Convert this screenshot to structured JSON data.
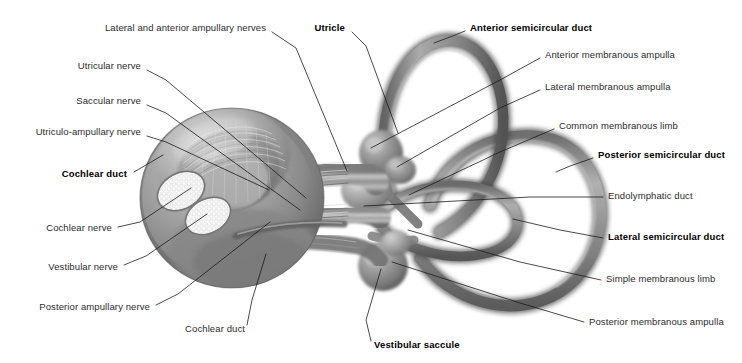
{
  "figure": {
    "style": "grayscale anatomical illustration",
    "width": 742,
    "height": 363,
    "background_color": "#ffffff",
    "text_color": "#2b2b2b",
    "bold_text_color": "#000000",
    "leader_line_color": "#1a1a1a"
  },
  "labels": [
    {
      "id": "lateral-and-anterior-ampullary-nerves",
      "text": "Lateral and anterior ampullary nerves",
      "bold": false,
      "side": "right-aligned",
      "x": 266,
      "y": 30,
      "leader": [
        [
          272,
          32
        ],
        [
          296,
          48
        ],
        [
          347,
          171
        ]
      ]
    },
    {
      "id": "utricle",
      "text": "Utricle",
      "bold": true,
      "side": "right-aligned",
      "x": 345,
      "y": 30,
      "leader": [
        [
          352,
          32
        ],
        [
          366,
          46
        ],
        [
          398,
          133
        ]
      ]
    },
    {
      "id": "utricular-nerve",
      "text": "Utricular nerve",
      "bold": false,
      "side": "right-aligned",
      "x": 141,
      "y": 68,
      "leader": [
        [
          147,
          70
        ],
        [
          166,
          80
        ],
        [
          306,
          198
        ]
      ]
    },
    {
      "id": "saccular-nerve",
      "text": "Saccular nerve",
      "bold": false,
      "side": "right-aligned",
      "x": 141,
      "y": 103,
      "leader": [
        [
          147,
          105
        ],
        [
          166,
          113
        ],
        [
          300,
          210
        ]
      ]
    },
    {
      "id": "utriculo-ampullary-nerve",
      "text": "Utriculo-ampullary nerve",
      "bold": false,
      "side": "right-aligned",
      "x": 141,
      "y": 134,
      "leader": [
        [
          147,
          136
        ],
        [
          166,
          142
        ],
        [
          269,
          190
        ]
      ]
    },
    {
      "id": "cochlear-duct-bold",
      "text": "Cochlear duct",
      "bold": true,
      "side": "right-aligned",
      "x": 127,
      "y": 176,
      "leader": [
        [
          134,
          172
        ],
        [
          163,
          155
        ]
      ]
    },
    {
      "id": "cochlear-nerve",
      "text": "Cochlear nerve",
      "bold": false,
      "side": "right-aligned",
      "x": 112,
      "y": 230,
      "leader": [
        [
          118,
          227
        ],
        [
          140,
          222
        ],
        [
          191,
          188
        ]
      ]
    },
    {
      "id": "vestibular-nerve",
      "text": "Vestibular nerve",
      "bold": false,
      "side": "right-aligned",
      "x": 118,
      "y": 269,
      "leader": [
        [
          124,
          265
        ],
        [
          146,
          256
        ],
        [
          207,
          214
        ]
      ]
    },
    {
      "id": "posterior-ampullary-nerve",
      "text": "Posterior ampullary nerve",
      "bold": false,
      "side": "right-aligned",
      "x": 150,
      "y": 309,
      "leader": [
        [
          156,
          305
        ],
        [
          178,
          294
        ],
        [
          270,
          222
        ]
      ]
    },
    {
      "id": "cochlear-duct-plain",
      "text": "Cochlear duct",
      "bold": false,
      "side": "right-aligned",
      "x": 245,
      "y": 331,
      "leader": [
        [
          247,
          325
        ],
        [
          252,
          300
        ],
        [
          266,
          254
        ]
      ]
    },
    {
      "id": "vestibular-saccule",
      "text": "Vestibular saccule",
      "bold": true,
      "side": "left-aligned",
      "x": 374,
      "y": 347,
      "leader": [
        [
          371,
          341
        ],
        [
          366,
          320
        ],
        [
          381,
          269
        ]
      ]
    },
    {
      "id": "anterior-semicircular-duct",
      "text": "Anterior semicircular duct",
      "bold": true,
      "side": "left-aligned",
      "x": 470,
      "y": 30,
      "leader": [
        [
          465,
          31
        ],
        [
          450,
          37
        ],
        [
          434,
          43
        ]
      ]
    },
    {
      "id": "anterior-membranous-ampulla",
      "text": "Anterior membranous ampulla",
      "bold": false,
      "side": "left-aligned",
      "x": 545,
      "y": 57,
      "leader": [
        [
          540,
          58
        ],
        [
          500,
          80
        ],
        [
          371,
          148
        ]
      ]
    },
    {
      "id": "lateral-membranous-ampulla",
      "text": "Lateral membranous ampulla",
      "bold": false,
      "side": "left-aligned",
      "x": 545,
      "y": 89,
      "leader": [
        [
          540,
          90
        ],
        [
          500,
          108
        ],
        [
          397,
          167
        ]
      ]
    },
    {
      "id": "common-membranous-limb",
      "text": "Common membranous limb",
      "bold": false,
      "side": "left-aligned",
      "x": 559,
      "y": 128,
      "leader": [
        [
          554,
          129
        ],
        [
          500,
          152
        ],
        [
          409,
          195
        ]
      ]
    },
    {
      "id": "posterior-semicircular-duct",
      "text": "Posterior semicircular duct",
      "bold": true,
      "side": "left-aligned",
      "x": 598,
      "y": 157,
      "leader": [
        [
          593,
          158
        ],
        [
          570,
          166
        ],
        [
          556,
          172
        ]
      ]
    },
    {
      "id": "endolymphatic-duct",
      "text": "Endolymphatic duct",
      "bold": false,
      "side": "left-aligned",
      "x": 608,
      "y": 198,
      "leader": [
        [
          603,
          197
        ],
        [
          530,
          197
        ],
        [
          364,
          206
        ]
      ]
    },
    {
      "id": "lateral-semicircular-duct",
      "text": "Lateral semicircular duct",
      "bold": true,
      "side": "left-aligned",
      "x": 608,
      "y": 239,
      "leader": [
        [
          603,
          238
        ],
        [
          560,
          230
        ],
        [
          513,
          219
        ]
      ]
    },
    {
      "id": "simple-membranous-limb",
      "text": "Simple membranous limb",
      "bold": false,
      "side": "left-aligned",
      "x": 606,
      "y": 281,
      "leader": [
        [
          601,
          280
        ],
        [
          520,
          262
        ],
        [
          408,
          230
        ]
      ]
    },
    {
      "id": "posterior-membranous-ampulla",
      "text": "Posterior membranous ampulla",
      "bold": false,
      "side": "left-aligned",
      "x": 589,
      "y": 324,
      "leader": [
        [
          584,
          322
        ],
        [
          520,
          303
        ],
        [
          392,
          262
        ]
      ]
    }
  ]
}
